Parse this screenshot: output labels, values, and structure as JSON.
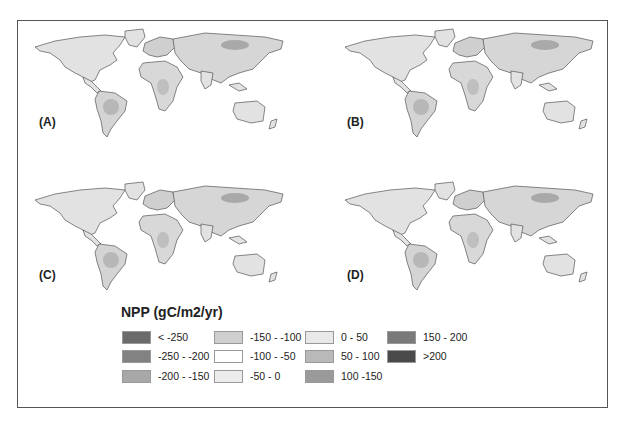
{
  "figure": {
    "panels": [
      {
        "label": "(A)",
        "intensity": 0.35
      },
      {
        "label": "(B)",
        "intensity": 0.8
      },
      {
        "label": "(C)",
        "intensity": 0.2
      },
      {
        "label": "(D)",
        "intensity": 0.55
      }
    ],
    "legend": {
      "title": "NPP (gC/m2/yr)",
      "items": [
        {
          "label": "< -250",
          "color": "#6b6b6b"
        },
        {
          "label": "-250 - -200",
          "color": "#828282"
        },
        {
          "label": "-200 - -150",
          "color": "#a8a8a8"
        },
        {
          "label": "-150 - -100",
          "color": "#cfcfcf"
        },
        {
          "label": "-100 - -50",
          "color": "#ffffff"
        },
        {
          "label": "-50 - 0",
          "color": "#ececec"
        },
        {
          "label": "0 - 50",
          "color": "#e9e9e9"
        },
        {
          "label": "50 - 100",
          "color": "#b9b9b9"
        },
        {
          "label": "100 -150",
          "color": "#9a9a9a"
        },
        {
          "label": "150 - 200",
          "color": "#7a7a7a"
        },
        {
          "label": ">200",
          "color": "#4a4a4a"
        }
      ]
    }
  }
}
